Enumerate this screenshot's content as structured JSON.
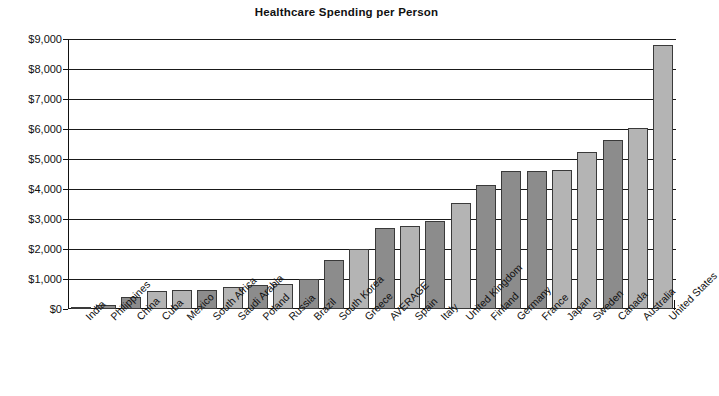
{
  "chart_data": {
    "type": "bar",
    "title": "Healthcare Spending per Person",
    "xlabel": "",
    "ylabel": "",
    "ylim": [
      0,
      9000
    ],
    "ytick_values": [
      0,
      1000,
      2000,
      3000,
      4000,
      5000,
      6000,
      7000,
      8000,
      9000
    ],
    "ytick_labels": [
      "$0",
      "$1,000",
      "$2,000",
      "$3,000",
      "$4,000",
      "$5,000",
      "$6,000",
      "$7,000",
      "$8,000",
      "$9,000"
    ],
    "grid": true,
    "legend": "none",
    "categories": [
      "India",
      "Philippines",
      "China",
      "Cuba",
      "Mexico",
      "South Africa",
      "Saudi Arabia",
      "Poland",
      "Russia",
      "Brazil",
      "South Korea",
      "Greece",
      "AVERAGE",
      "Spain",
      "Italy",
      "United Kingdom",
      "Finland",
      "Germany",
      "France",
      "Japan",
      "Sweden",
      "Canada",
      "Australia",
      "United States"
    ],
    "values": [
      80,
      150,
      400,
      600,
      620,
      640,
      750,
      800,
      850,
      1000,
      1650,
      2000,
      2700,
      2760,
      2950,
      3550,
      4150,
      4600,
      4600,
      4650,
      5230,
      5620,
      6020,
      8800
    ],
    "bar_colors": [
      "#b4b4b4",
      "#8c8c8c",
      "#8c8c8c",
      "#b4b4b4",
      "#b4b4b4",
      "#8c8c8c",
      "#b4b4b4",
      "#8c8c8c",
      "#b4b4b4",
      "#8c8c8c",
      "#8c8c8c",
      "#b4b4b4",
      "#8c8c8c",
      "#b4b4b4",
      "#8c8c8c",
      "#b4b4b4",
      "#8c8c8c",
      "#8c8c8c",
      "#8c8c8c",
      "#b4b4b4",
      "#b4b4b4",
      "#8c8c8c",
      "#b4b4b4",
      "#b4b4b4"
    ],
    "colors": {
      "bar_light": "#b4b4b4",
      "bar_dark": "#8c8c8c",
      "bar_edge": "#3a3a3a",
      "axis": "#111111",
      "background": "#ffffff"
    }
  }
}
